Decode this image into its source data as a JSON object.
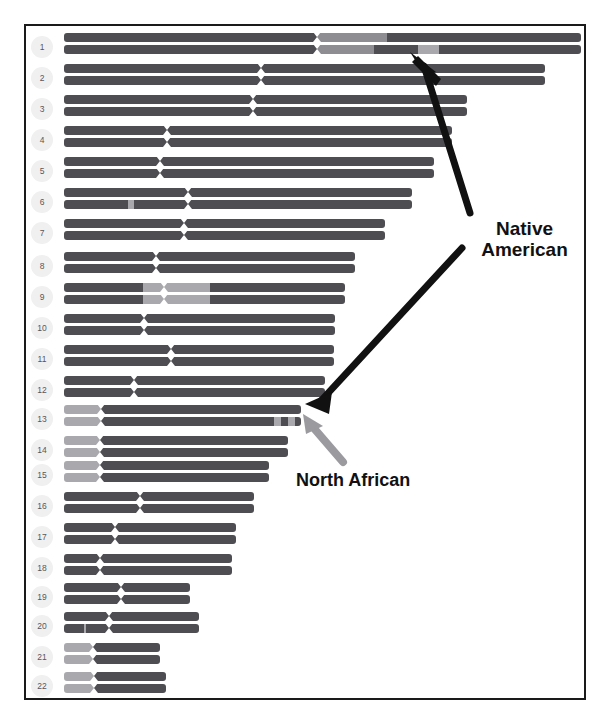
{
  "figure": {
    "title_fragment": "",
    "panel_border_color": "#1a1a1a",
    "background": "#ffffff"
  },
  "legend_colors": {
    "dark_segment": "#4d4d52",
    "light_segment": "#a9a9ad",
    "mid_segment": "#8d8d92",
    "badge_background": "#f0f0f0",
    "badge_text": "#57575c",
    "annotation_text": "#111111",
    "arrow": "#111111",
    "arrow_light": "#9a9a9f"
  },
  "annotations": [
    {
      "id": "native-american",
      "label": "Native American",
      "line1": "Native",
      "line2": "American"
    },
    {
      "id": "north-african",
      "label": "North African",
      "line1": "North African",
      "line2": ""
    }
  ],
  "chart_data": {
    "type": "bar",
    "xlabel": "",
    "ylabel": "Chromosome",
    "categories": [
      "1",
      "2",
      "3",
      "4",
      "5",
      "6",
      "7",
      "8",
      "9",
      "10",
      "11",
      "12",
      "13",
      "14",
      "15",
      "16",
      "17",
      "18",
      "19",
      "20",
      "21",
      "22"
    ],
    "series": [
      {
        "name": "Paternal copy",
        "values": [
          517,
          481,
          403,
          388,
          370,
          348,
          321,
          291,
          281,
          271,
          270,
          261,
          237,
          224,
          205,
          190,
          172,
          168,
          126,
          135,
          96,
          102
        ]
      },
      {
        "name": "Maternal copy",
        "values": [
          517,
          481,
          403,
          388,
          370,
          348,
          321,
          291,
          281,
          271,
          270,
          261,
          237,
          224,
          205,
          190,
          172,
          168,
          126,
          135,
          96,
          102
        ]
      }
    ]
  },
  "chromosomes": [
    {
      "number": "1",
      "y": 33,
      "length": 517,
      "centromere": 0.49,
      "haplotypes": [
        {
          "segments": [
            {
              "start": 0,
              "end": 0.49,
              "tone": "dark"
            },
            {
              "start": 0.49,
              "end": 0.625,
              "tone": "mid"
            },
            {
              "start": 0.625,
              "end": 1,
              "tone": "dark"
            }
          ]
        },
        {
          "segments": [
            {
              "start": 0,
              "end": 0.49,
              "tone": "dark"
            },
            {
              "start": 0.49,
              "end": 0.6,
              "tone": "mid"
            },
            {
              "start": 0.6,
              "end": 0.685,
              "tone": "dark"
            },
            {
              "start": 0.685,
              "end": 0.725,
              "tone": "light"
            },
            {
              "start": 0.725,
              "end": 1,
              "tone": "dark"
            }
          ]
        }
      ]
    },
    {
      "number": "2",
      "y": 64,
      "length": 481,
      "centromere": 0.41,
      "haplotypes": [
        {
          "segments": [
            {
              "start": 0,
              "end": 1,
              "tone": "dark"
            }
          ]
        },
        {
          "segments": [
            {
              "start": 0,
              "end": 1,
              "tone": "dark"
            }
          ]
        }
      ]
    },
    {
      "number": "3",
      "y": 95,
      "length": 403,
      "centromere": 0.47,
      "haplotypes": [
        {
          "segments": [
            {
              "start": 0,
              "end": 1,
              "tone": "dark"
            }
          ]
        },
        {
          "segments": [
            {
              "start": 0,
              "end": 1,
              "tone": "dark"
            }
          ]
        }
      ]
    },
    {
      "number": "4",
      "y": 126,
      "length": 388,
      "centromere": 0.265,
      "haplotypes": [
        {
          "segments": [
            {
              "start": 0,
              "end": 1,
              "tone": "dark"
            }
          ]
        },
        {
          "segments": [
            {
              "start": 0,
              "end": 1,
              "tone": "dark"
            }
          ]
        }
      ]
    },
    {
      "number": "5",
      "y": 157,
      "length": 370,
      "centromere": 0.26,
      "haplotypes": [
        {
          "segments": [
            {
              "start": 0,
              "end": 1,
              "tone": "dark"
            }
          ]
        },
        {
          "segments": [
            {
              "start": 0,
              "end": 1,
              "tone": "dark"
            }
          ]
        }
      ]
    },
    {
      "number": "6",
      "y": 188,
      "length": 348,
      "centromere": 0.355,
      "haplotypes": [
        {
          "segments": [
            {
              "start": 0,
              "end": 1,
              "tone": "dark"
            }
          ]
        },
        {
          "segments": [
            {
              "start": 0,
              "end": 0.185,
              "tone": "dark"
            },
            {
              "start": 0.185,
              "end": 0.2,
              "tone": "light"
            },
            {
              "start": 0.2,
              "end": 1,
              "tone": "dark"
            }
          ]
        }
      ]
    },
    {
      "number": "7",
      "y": 219,
      "length": 321,
      "centromere": 0.375,
      "haplotypes": [
        {
          "segments": [
            {
              "start": 0,
              "end": 1,
              "tone": "dark"
            }
          ]
        },
        {
          "segments": [
            {
              "start": 0,
              "end": 1,
              "tone": "dark"
            }
          ]
        }
      ]
    },
    {
      "number": "8",
      "y": 252,
      "length": 291,
      "centromere": 0.315,
      "haplotypes": [
        {
          "segments": [
            {
              "start": 0,
              "end": 1,
              "tone": "dark"
            }
          ]
        },
        {
          "segments": [
            {
              "start": 0,
              "end": 1,
              "tone": "dark"
            }
          ]
        }
      ]
    },
    {
      "number": "9",
      "y": 283,
      "length": 281,
      "centromere": 0.355,
      "haplotypes": [
        {
          "segments": [
            {
              "start": 0,
              "end": 0.28,
              "tone": "dark"
            },
            {
              "start": 0.28,
              "end": 0.52,
              "tone": "light"
            },
            {
              "start": 0.52,
              "end": 1,
              "tone": "dark"
            }
          ]
        },
        {
          "segments": [
            {
              "start": 0,
              "end": 0.28,
              "tone": "dark"
            },
            {
              "start": 0.28,
              "end": 0.52,
              "tone": "light"
            },
            {
              "start": 0.52,
              "end": 1,
              "tone": "dark"
            }
          ]
        }
      ]
    },
    {
      "number": "10",
      "y": 314,
      "length": 271,
      "centromere": 0.295,
      "haplotypes": [
        {
          "segments": [
            {
              "start": 0,
              "end": 1,
              "tone": "dark"
            }
          ]
        },
        {
          "segments": [
            {
              "start": 0,
              "end": 1,
              "tone": "dark"
            }
          ]
        }
      ]
    },
    {
      "number": "11",
      "y": 345,
      "length": 270,
      "centromere": 0.395,
      "haplotypes": [
        {
          "segments": [
            {
              "start": 0,
              "end": 1,
              "tone": "dark"
            }
          ]
        },
        {
          "segments": [
            {
              "start": 0,
              "end": 1,
              "tone": "dark"
            }
          ]
        }
      ]
    },
    {
      "number": "12",
      "y": 376,
      "length": 261,
      "centromere": 0.27,
      "haplotypes": [
        {
          "segments": [
            {
              "start": 0,
              "end": 1,
              "tone": "dark"
            }
          ]
        },
        {
          "segments": [
            {
              "start": 0,
              "end": 1,
              "tone": "dark"
            }
          ]
        }
      ]
    },
    {
      "number": "13",
      "y": 405,
      "length": 237,
      "centromere": 0.155,
      "haplotypes": [
        {
          "segments": [
            {
              "start": 0,
              "end": 0.155,
              "tone": "light"
            },
            {
              "start": 0.155,
              "end": 1,
              "tone": "dark"
            }
          ]
        },
        {
          "segments": [
            {
              "start": 0,
              "end": 0.155,
              "tone": "light"
            },
            {
              "start": 0.155,
              "end": 0.885,
              "tone": "dark"
            },
            {
              "start": 0.885,
              "end": 0.915,
              "tone": "light"
            },
            {
              "start": 0.915,
              "end": 0.945,
              "tone": "dark"
            },
            {
              "start": 0.945,
              "end": 0.975,
              "tone": "light"
            },
            {
              "start": 0.975,
              "end": 1,
              "tone": "dark"
            }
          ]
        }
      ]
    },
    {
      "number": "14",
      "y": 436,
      "length": 224,
      "centromere": 0.16,
      "haplotypes": [
        {
          "segments": [
            {
              "start": 0,
              "end": 0.16,
              "tone": "light"
            },
            {
              "start": 0.16,
              "end": 1,
              "tone": "dark"
            }
          ]
        },
        {
          "segments": [
            {
              "start": 0,
              "end": 0.16,
              "tone": "light"
            },
            {
              "start": 0.16,
              "end": 1,
              "tone": "dark"
            }
          ]
        }
      ]
    },
    {
      "number": "15",
      "y": 461,
      "length": 205,
      "centromere": 0.175,
      "haplotypes": [
        {
          "segments": [
            {
              "start": 0,
              "end": 0.175,
              "tone": "light"
            },
            {
              "start": 0.175,
              "end": 1,
              "tone": "dark"
            }
          ]
        },
        {
          "segments": [
            {
              "start": 0,
              "end": 0.175,
              "tone": "light"
            },
            {
              "start": 0.175,
              "end": 1,
              "tone": "dark"
            }
          ]
        }
      ]
    },
    {
      "number": "16",
      "y": 492,
      "length": 190,
      "centromere": 0.4,
      "haplotypes": [
        {
          "segments": [
            {
              "start": 0,
              "end": 1,
              "tone": "dark"
            }
          ]
        },
        {
          "segments": [
            {
              "start": 0,
              "end": 1,
              "tone": "dark"
            }
          ]
        }
      ]
    },
    {
      "number": "17",
      "y": 523,
      "length": 172,
      "centromere": 0.295,
      "haplotypes": [
        {
          "segments": [
            {
              "start": 0,
              "end": 1,
              "tone": "dark"
            }
          ]
        },
        {
          "segments": [
            {
              "start": 0,
              "end": 1,
              "tone": "dark"
            }
          ]
        }
      ]
    },
    {
      "number": "18",
      "y": 554,
      "length": 168,
      "centromere": 0.215,
      "haplotypes": [
        {
          "segments": [
            {
              "start": 0,
              "end": 1,
              "tone": "dark"
            }
          ]
        },
        {
          "segments": [
            {
              "start": 0,
              "end": 1,
              "tone": "dark"
            }
          ]
        }
      ]
    },
    {
      "number": "19",
      "y": 583,
      "length": 126,
      "centromere": 0.455,
      "haplotypes": [
        {
          "segments": [
            {
              "start": 0,
              "end": 1,
              "tone": "dark"
            }
          ]
        },
        {
          "segments": [
            {
              "start": 0,
              "end": 1,
              "tone": "dark"
            }
          ]
        }
      ]
    },
    {
      "number": "20",
      "y": 612,
      "length": 135,
      "centromere": 0.33,
      "haplotypes": [
        {
          "segments": [
            {
              "start": 0,
              "end": 1,
              "tone": "dark"
            }
          ]
        },
        {
          "segments": [
            {
              "start": 0,
              "end": 0.145,
              "tone": "dark"
            },
            {
              "start": 0.145,
              "end": 0.165,
              "tone": "light"
            },
            {
              "start": 0.165,
              "end": 1,
              "tone": "dark"
            }
          ]
        }
      ]
    },
    {
      "number": "21",
      "y": 643,
      "length": 96,
      "centromere": 0.3,
      "haplotypes": [
        {
          "segments": [
            {
              "start": 0,
              "end": 0.3,
              "tone": "light"
            },
            {
              "start": 0.3,
              "end": 1,
              "tone": "dark"
            }
          ]
        },
        {
          "segments": [
            {
              "start": 0,
              "end": 0.3,
              "tone": "light"
            },
            {
              "start": 0.3,
              "end": 1,
              "tone": "dark"
            }
          ]
        }
      ]
    },
    {
      "number": "22",
      "y": 672,
      "length": 102,
      "centromere": 0.295,
      "haplotypes": [
        {
          "segments": [
            {
              "start": 0,
              "end": 0.295,
              "tone": "light"
            },
            {
              "start": 0.295,
              "end": 1,
              "tone": "dark"
            }
          ]
        },
        {
          "segments": [
            {
              "start": 0,
              "end": 0.295,
              "tone": "light"
            },
            {
              "start": 0.295,
              "end": 1,
              "tone": "dark"
            }
          ]
        }
      ]
    }
  ]
}
